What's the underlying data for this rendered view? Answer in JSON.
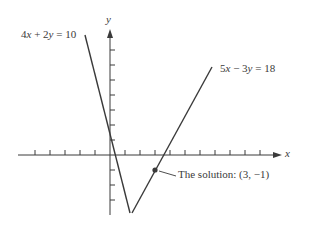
{
  "axes": {
    "x_label": "x",
    "y_label": "y",
    "origin_px": [
      110,
      155
    ],
    "unit_px": 15,
    "x_ticks": [
      -5,
      -4,
      -3,
      -2,
      -1,
      1,
      2,
      3,
      4,
      5,
      6,
      7,
      8,
      9,
      10,
      11
    ],
    "y_ticks": [
      -3,
      -2,
      -1,
      1,
      2,
      3,
      4,
      5,
      6,
      7
    ]
  },
  "lines": [
    {
      "equation": "4x + 2y = 10",
      "label_parts": [
        "4",
        "x",
        " + 2",
        "y",
        " = 10"
      ],
      "color": "#3a3a3a"
    },
    {
      "equation": "5x − 3y = 18",
      "label_parts": [
        "5",
        "x",
        " − 3",
        "y",
        " = 18"
      ],
      "color": "#3a3a3a"
    }
  ],
  "solution": {
    "label": "The solution: (3, −1)",
    "point": [
      3,
      -1
    ]
  },
  "colors": {
    "ink": "#3a3a3a",
    "background": "#ffffff"
  }
}
